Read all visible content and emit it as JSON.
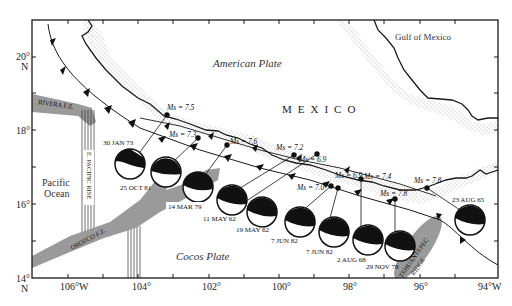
{
  "map": {
    "labels": {
      "american_plate": "American Plate",
      "gulf": "Gulf of Mexico",
      "country": "MEXICO",
      "pacific_1": "Pacific",
      "pacific_2": "Ocean",
      "cocos_plate": "Cocos Plate",
      "rivera": "RIVERA F.Z.",
      "epr": "E. PACIFIC RISE",
      "orozco": "OROZCO F.Z.",
      "tehuantepec_1": "TEHUANTEPEC",
      "tehuantepec_2": "RIDGE"
    },
    "lat_ticks": [
      {
        "label": "20°",
        "sub": "N"
      },
      {
        "label": "18°"
      },
      {
        "label": "16°"
      },
      {
        "label": "14°",
        "sub": "N"
      }
    ],
    "lon_ticks": [
      "106°W",
      "104°",
      "102°",
      "100°",
      "98°",
      "96°",
      "94°W"
    ],
    "events": [
      {
        "date": "30 JAN 73",
        "mag": "Ms = 7.5"
      },
      {
        "date": "25 OCT 81",
        "mag": "Ms = 7.3"
      },
      {
        "date": "14 MAR 79",
        "mag": "Ms = 7.6"
      },
      {
        "date": "11 MAY 62",
        "mag": "Ms = 7.2"
      },
      {
        "date": "19 MAY 62",
        "mag": "Ms = 6.9"
      },
      {
        "date": "7 JUN 82",
        "mag": "Ms = 7.0"
      },
      {
        "date": "7 JUN 82",
        "mag": "Ms = 6.9"
      },
      {
        "date": "2 AUG 68",
        "mag": "Ms = 7.4"
      },
      {
        "date": "29 NOV 78",
        "mag": "Ms = 7.8"
      },
      {
        "date": "23 AUG 65",
        "mag": "Ms = 7.8"
      }
    ],
    "colors": {
      "frame": "#222222",
      "zone_fill": "#9a9a9a",
      "dots": "#aaaaaa"
    }
  }
}
